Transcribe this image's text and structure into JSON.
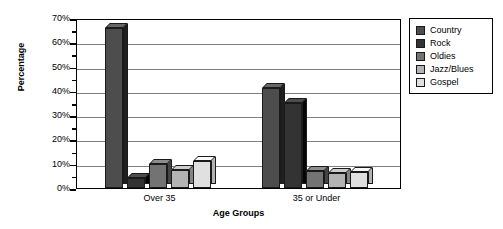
{
  "chart_data": {
    "type": "bar",
    "title": "",
    "xlabel": "Age Groups",
    "ylabel": "Percentage",
    "categories": [
      "Over 35",
      "35 or Under"
    ],
    "series": [
      {
        "name": "Country",
        "values": [
          66,
          41
        ],
        "color": "#4d4d4d"
      },
      {
        "name": "Rock",
        "values": [
          4,
          35
        ],
        "color": "#333333"
      },
      {
        "name": "Oldies",
        "values": [
          10,
          7
        ],
        "color": "#737373"
      },
      {
        "name": "Jazz/Blues",
        "values": [
          7.5,
          6
        ],
        "color": "#b3b3b3"
      },
      {
        "name": "Gospel",
        "values": [
          11,
          6.5
        ],
        "color": "#e0e0e0"
      }
    ],
    "ylim": [
      0,
      70
    ],
    "y_ticks": [
      "0%",
      "10%",
      "20%",
      "30%",
      "40%",
      "50%",
      "60%",
      "70%"
    ],
    "y_tick_values": [
      0,
      10,
      20,
      30,
      40,
      50,
      60,
      70
    ],
    "y_minor_tick_values": [
      5,
      15,
      25,
      35,
      45,
      55,
      65
    ],
    "grid": true,
    "legend_position": "right",
    "style": "3d-bar",
    "gridline_color": "#808080",
    "axis_color": "#000000",
    "background": "#ffffff"
  },
  "legend": {
    "entries": [
      {
        "label": "Country",
        "color": "#4d4d4d"
      },
      {
        "label": "Rock",
        "color": "#333333"
      },
      {
        "label": "Oldies",
        "color": "#737373"
      },
      {
        "label": "Jazz/Blues",
        "color": "#b3b3b3"
      },
      {
        "label": "Gospel",
        "color": "#e0e0e0"
      }
    ]
  },
  "axes": {
    "y_title": "Percentage",
    "x_title": "Age Groups"
  }
}
